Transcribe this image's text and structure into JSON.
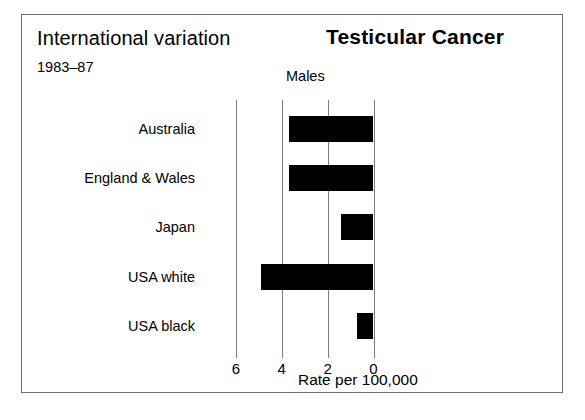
{
  "header": {
    "left_title": "International variation",
    "period": "1983–87",
    "main_title": "Testicular Cancer",
    "subtitle": "Males"
  },
  "axis": {
    "title": "Rate per 100,000",
    "tick_labels": [
      "6",
      "4",
      "2",
      "0"
    ]
  },
  "colors": {
    "bar": "#000000",
    "gridline": "#7d7d7d",
    "frame": "#6e6e6e",
    "background": "#ffffff",
    "text": "#000000"
  },
  "chart_data": {
    "type": "bar",
    "orientation": "horizontal",
    "title": "Testicular Cancer",
    "subtitle": "Males",
    "annotation_left": "International variation",
    "annotation_period": "1983–87",
    "categories": [
      "Australia",
      "England & Wales",
      "Japan",
      "USA white",
      "USA black"
    ],
    "values": [
      3.7,
      3.7,
      1.4,
      4.9,
      0.7
    ],
    "xlabel": "Rate per 100,000",
    "ylabel": "",
    "xlim": [
      0,
      6.6
    ],
    "x_ticks": [
      6,
      4,
      2,
      0
    ],
    "x_axis_reversed": true,
    "grid": true,
    "legend": false,
    "bars": [
      {
        "category": "Australia",
        "value": 3.7
      },
      {
        "category": "England & Wales",
        "value": 3.7
      },
      {
        "category": "Japan",
        "value": 1.4
      },
      {
        "category": "USA white",
        "value": 4.9
      },
      {
        "category": "USA black",
        "value": 0.7
      }
    ]
  }
}
